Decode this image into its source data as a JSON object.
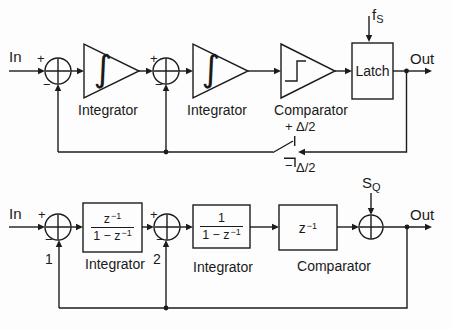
{
  "figure": {
    "top": {
      "in_label": "In",
      "out_label": "Out",
      "sum1": {
        "plus": "+",
        "minus": "−"
      },
      "sum2": {
        "plus": "+",
        "minus": "−"
      },
      "integrator1": {
        "symbol": "∫",
        "label": "Integrator"
      },
      "integrator2": {
        "symbol": "∫",
        "label": "Integrator"
      },
      "comparator_label": "Comparator",
      "latch_label": "Latch",
      "clock": {
        "base": "f",
        "sub": "S"
      },
      "dac": {
        "plus_sign": "+",
        "plus_value": "Δ/2",
        "minus_sign": "−",
        "minus_value": "Δ/2"
      }
    },
    "bottom": {
      "in_label": "In",
      "out_label": "Out",
      "sum1": {
        "plus": "+",
        "minus": "−",
        "node": "1"
      },
      "sum2": {
        "plus": "+",
        "minus": "−",
        "node": "2"
      },
      "block1": {
        "num_base": "z",
        "num_sup": "−1",
        "den_base": "1 − z",
        "den_sup": "−1",
        "label": "Integrator"
      },
      "block2": {
        "num": "1",
        "den_base": "1 − z",
        "den_sup": "−1",
        "label": "Integrator"
      },
      "block3": {
        "base": "z",
        "sup": "−1",
        "label": "Comparator"
      },
      "noise": {
        "base": "S",
        "sub": "Q"
      }
    }
  }
}
